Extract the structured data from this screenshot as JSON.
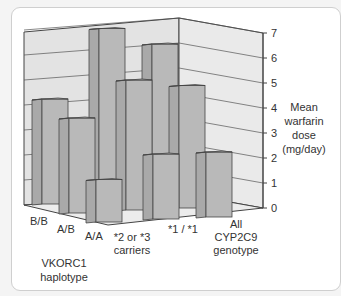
{
  "chart_data": {
    "type": "bar",
    "subtype": "3d-bar",
    "title": "",
    "categories": [
      "*2 or *3 carriers",
      "*1 / *1",
      "All CYP2C9 genotype"
    ],
    "category_lines": [
      [
        "*2 or *3",
        "carriers"
      ],
      [
        "*1 / *1"
      ],
      [
        "All",
        "CYP2C9",
        "genotype"
      ]
    ],
    "depth_categories": [
      "B/B",
      "A/B",
      "A/A"
    ],
    "series": [
      {
        "name": "B/B",
        "values": [
          4.2,
          6.9,
          6.2
        ]
      },
      {
        "name": "A/B",
        "values": [
          3.8,
          5.2,
          4.9
        ]
      },
      {
        "name": "A/A",
        "values": [
          1.7,
          2.6,
          2.6
        ]
      }
    ],
    "xlabel": "",
    "depth_label": [
      "VKORC1",
      "haplotype"
    ],
    "ylabel": [
      "Mean",
      "warfarin",
      "dose",
      "(mg/day)"
    ],
    "yticks": [
      0,
      1,
      2,
      3,
      4,
      5,
      6,
      7
    ],
    "ylim": [
      0,
      7
    ],
    "grid": true,
    "legend": null,
    "colors": {
      "wall": "#e3e3e3",
      "floor": "#ececec",
      "bar_front": "#b9b9b9",
      "bar_side": "#a9a9a9",
      "bar_top": "#cfcfcf",
      "edge": "#444444",
      "grid": "#555555"
    }
  }
}
